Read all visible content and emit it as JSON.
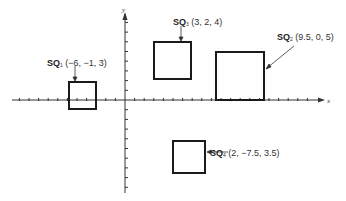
{
  "diagram": {
    "axes": {
      "x_label": "x",
      "y_label": "y"
    },
    "squares": [
      {
        "name": "SQ",
        "sub": "1",
        "coords": "(−6, −1, 3)"
      },
      {
        "name": "SQ",
        "sub": "2",
        "coords": "(9.5, 0, 5)"
      },
      {
        "name": "SQ",
        "sub": "3",
        "coords": "(3, 2, 4)"
      },
      {
        "name": "SQ",
        "sub": "4",
        "coords": "(2, −7.5, 3.5)"
      }
    ],
    "colors": {
      "line": "#1a1a1a",
      "text": "#333333",
      "background": "#ffffff"
    }
  }
}
